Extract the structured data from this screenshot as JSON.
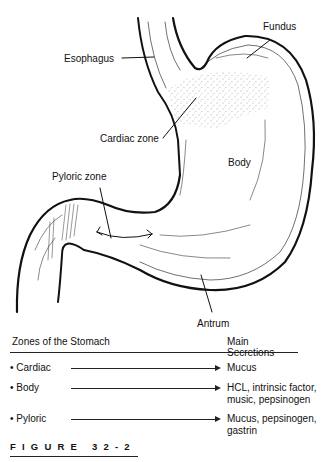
{
  "figure": {
    "caption": "FIGURE 32-2",
    "labels": {
      "esophagus": "Esophagus",
      "fundus": "Fundus",
      "cardiac_zone": "Cardiac zone",
      "body": "Body",
      "pyloric_zone": "Pyloric zone",
      "antrum": "Antrum"
    }
  },
  "table": {
    "headers": {
      "zones": "Zones of the Stomach",
      "secretions": "Main Secretions"
    },
    "rows": [
      {
        "zone": "• Cardiac",
        "secretions": "Mucus"
      },
      {
        "zone": "• Body",
        "secretions": "HCL, intrinsic factor,\nmusic, pepsinogen"
      },
      {
        "zone": "• Pyloric",
        "secretions": "Mucus, pepsinogen,\ngastrin"
      }
    ]
  }
}
